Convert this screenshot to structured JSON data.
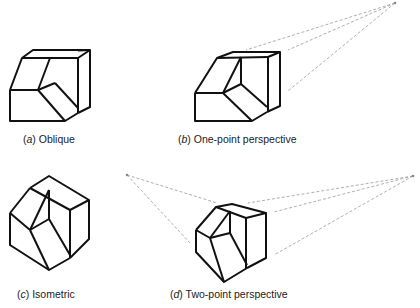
{
  "figures": [
    {
      "id": "a",
      "letter": "a",
      "title": "Oblique"
    },
    {
      "id": "b",
      "letter": "b",
      "title": "One-point perspective"
    },
    {
      "id": "c",
      "letter": "c",
      "title": "Isometric"
    },
    {
      "id": "d",
      "letter": "d",
      "title": "Two-point perspective"
    }
  ],
  "colors": {
    "stroke": "#111111",
    "construction": "#9a9a9a",
    "background": "#ffffff"
  }
}
